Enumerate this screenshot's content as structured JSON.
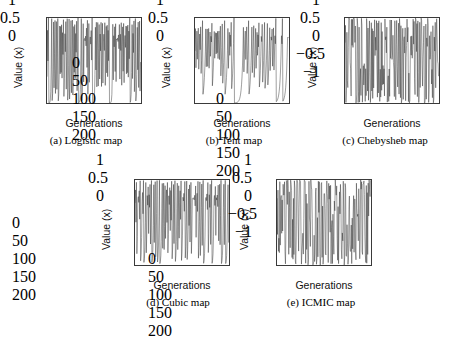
{
  "figure": {
    "background": "#ffffff",
    "line_color": "#2b2b2b",
    "axis_color": "#3a3a3a",
    "panel_count": 5
  },
  "chart_data": [
    {
      "id": "logistic",
      "type": "line",
      "title": "(a) Logistic map",
      "xlabel": "Generations",
      "ylabel": "Value (x)",
      "xlim": [
        0,
        200
      ],
      "ylim": [
        0,
        1
      ],
      "xticks": [
        0,
        50,
        100,
        150,
        200
      ],
      "xticklabels": [
        "0",
        "50",
        "100",
        "150",
        "200"
      ],
      "yticks": [
        0,
        0.5,
        1
      ],
      "yticklabels": [
        "0",
        "0.5",
        "1"
      ],
      "grid": false,
      "legend": null,
      "n_points": 200,
      "map_equation": "x(n+1) = 4*x(n)*(1-x(n))",
      "seed": 0.31,
      "series": [
        {
          "name": "Logistic map value",
          "generator": "logistic",
          "param": 4.0,
          "x0": 0.31
        }
      ]
    },
    {
      "id": "tent",
      "type": "line",
      "title": "(b) Tent map",
      "xlabel": "Generations",
      "ylabel": "Value (x)",
      "xlim": [
        0,
        200
      ],
      "ylim": [
        0,
        1
      ],
      "xticks": [
        0,
        50,
        100,
        150,
        200
      ],
      "xticklabels": [
        "0",
        "50",
        "100",
        "150",
        "200"
      ],
      "yticks": [
        0,
        0.5,
        1
      ],
      "yticklabels": [
        "0",
        "0.5",
        "1"
      ],
      "grid": false,
      "legend": null,
      "n_points": 200,
      "map_equation": "x(n+1) = x(n)/0.7 if x(n)<0.7 else (10/3)*(1-x(n))",
      "seed": 0.613,
      "series": [
        {
          "name": "Tent map value",
          "generator": "tent",
          "param": 0.7,
          "x0": 0.613
        }
      ]
    },
    {
      "id": "chebysheb",
      "type": "line",
      "title": "(c) Chebysheb map",
      "xlabel": "Generations",
      "ylabel": "Value (x)",
      "xlim": [
        0,
        200
      ],
      "ylim": [
        -1,
        1
      ],
      "xticks": [
        0,
        50,
        100,
        150,
        200
      ],
      "xticklabels": [
        "0",
        "50",
        "100",
        "150",
        "200"
      ],
      "yticks": [
        -1,
        -0.5,
        0,
        0.5,
        1
      ],
      "yticklabels": [
        "−1",
        "−0.5",
        "0",
        "0.5",
        "1"
      ],
      "grid": false,
      "legend": null,
      "n_points": 200,
      "map_equation": "x(n+1) = cos(5*arccos(x(n)))",
      "seed": 0.42,
      "series": [
        {
          "name": "Chebysheb map value",
          "generator": "chebysheb",
          "param": 5,
          "x0": 0.42
        }
      ]
    },
    {
      "id": "cubic",
      "type": "line",
      "title": "(d) Cubic map",
      "xlabel": "Generations",
      "ylabel": "Value (x)",
      "xlim": [
        0,
        200
      ],
      "ylim": [
        0,
        1
      ],
      "xticks": [
        0,
        50,
        100,
        150,
        200
      ],
      "xticklabels": [
        "0",
        "50",
        "100",
        "150",
        "200"
      ],
      "yticks": [
        0,
        0.5,
        1
      ],
      "yticklabels": [
        "0",
        "0.5",
        "1"
      ],
      "grid": false,
      "legend": null,
      "n_points": 200,
      "map_equation": "x(n+1) = 2.59*x(n)*(1-x(n)^2)",
      "seed": 0.73,
      "series": [
        {
          "name": "Cubic map value",
          "generator": "cubic",
          "param": 2.59,
          "x0": 0.73
        }
      ]
    },
    {
      "id": "icmic",
      "type": "line",
      "title": "(e) ICMIC map",
      "xlabel": "Generations",
      "ylabel": "Value (x)",
      "xlim": [
        0,
        200
      ],
      "ylim": [
        -1,
        1
      ],
      "xticks": [
        0,
        50,
        100,
        150,
        200
      ],
      "xticklabels": [
        "0",
        "50",
        "100",
        "150",
        "200"
      ],
      "yticks": [
        -1,
        -0.5,
        0,
        0.5,
        1
      ],
      "yticklabels": [
        "−1",
        "−0.5",
        "0",
        "0.5",
        "1"
      ],
      "grid": false,
      "legend": null,
      "n_points": 200,
      "map_equation": "x(n+1) = sin(70/x(n))",
      "seed": 0.57,
      "series": [
        {
          "name": "ICMIC map value",
          "generator": "icmic",
          "param": 70,
          "x0": 0.57
        }
      ]
    }
  ]
}
